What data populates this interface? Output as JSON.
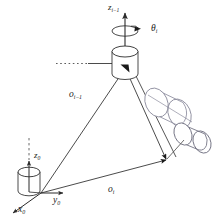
{
  "figure": {
    "background_color": "#ffffff",
    "line_color": "#2b2b2b",
    "label_color": "#1a1a1a",
    "width": 221,
    "height": 219
  },
  "labels": {
    "z_joint": {
      "base": "z",
      "sub": "i−1",
      "text": "z i−1"
    },
    "theta_joint": {
      "base": "θ",
      "sub": "i",
      "text": "θ i"
    },
    "o_joint_prev": {
      "base": "o",
      "sub": "i−1",
      "text": "o i−1"
    },
    "z_base": {
      "base": "z",
      "sub": "0",
      "text": "z 0"
    },
    "y_base": {
      "base": "y",
      "sub": "0",
      "text": "y 0"
    },
    "x_base": {
      "base": "x",
      "sub": "0",
      "text": "x 0"
    },
    "o_joint": {
      "base": "o",
      "sub": "i",
      "text": "o i"
    }
  },
  "elements": {
    "base_frame": "base coordinate frame at origin o_0 with cylinder",
    "joint_cylinder": "revolute joint cylinder at o_(i-1)",
    "rotation_arc": "curved arrow about z_(i-1) indicating theta_i rotation",
    "link_cylinder_upper": "tilted link cylinder right of joint",
    "link_cylinder_lower": "tilted end-effector cylinder lower right",
    "vector_o_im1": "vector from base origin to joint origin o_(i-1)",
    "vector_o_i": "vector from base origin to point o_i",
    "vector_joint_to_oi": "vector from joint origin to o_i",
    "dotted_reference_line": "horizontal dotted reference line entering joint",
    "dashed_z_extension": "dashed extension above z_0 axis"
  }
}
